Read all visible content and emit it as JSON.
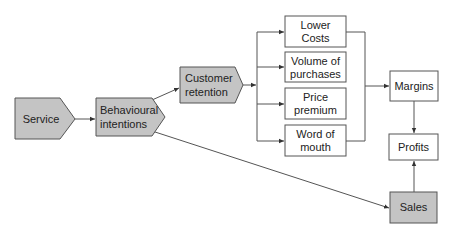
{
  "diagram": {
    "colors": {
      "shaded_fill": "#c4c4c4",
      "white_fill": "#ffffff",
      "stroke": "#555555",
      "text": "#222222"
    },
    "nodes": {
      "service": {
        "line1": "Service"
      },
      "behavioural": {
        "line1": "Behavioural",
        "line2": "intentions"
      },
      "retention": {
        "line1": "Customer",
        "line2": "retention"
      },
      "lower_costs": {
        "line1": "Lower",
        "line2": "Costs"
      },
      "volume": {
        "line1": "Volume of",
        "line2": "purchases"
      },
      "price": {
        "line1": "Price",
        "line2": "premium"
      },
      "word": {
        "line1": "Word of",
        "line2": "mouth"
      },
      "margins": {
        "line1": "Margins"
      },
      "profits": {
        "line1": "Profits"
      },
      "sales": {
        "line1": "Sales"
      }
    },
    "edges": [
      {
        "from": "Service",
        "to": "Behavioural intentions"
      },
      {
        "from": "Behavioural intentions",
        "to": "Customer retention"
      },
      {
        "from": "Behavioural intentions",
        "to": "Sales"
      },
      {
        "from": "Customer retention",
        "to": "Lower Costs"
      },
      {
        "from": "Customer retention",
        "to": "Volume of purchases"
      },
      {
        "from": "Customer retention",
        "to": "Price premium"
      },
      {
        "from": "Customer retention",
        "to": "Word of mouth"
      },
      {
        "from": "Lower Costs",
        "to": "Margins"
      },
      {
        "from": "Volume of purchases",
        "to": "Margins"
      },
      {
        "from": "Price premium",
        "to": "Margins"
      },
      {
        "from": "Word of mouth",
        "to": "Margins"
      },
      {
        "from": "Margins",
        "to": "Profits"
      },
      {
        "from": "Sales",
        "to": "Profits"
      }
    ]
  }
}
